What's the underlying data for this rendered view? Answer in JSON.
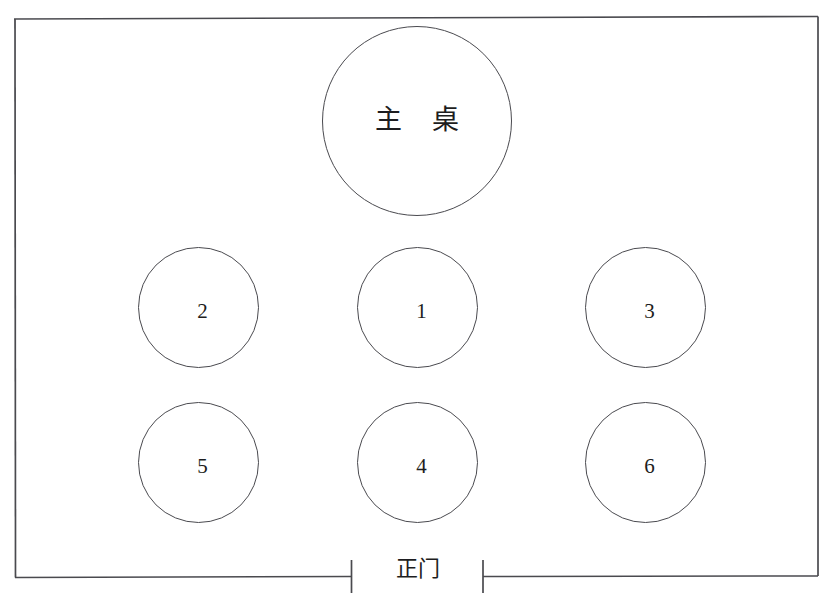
{
  "diagram": {
    "title_text": "主 桌",
    "entrance_label": "正门",
    "line_color": "#4a4a4f",
    "text_color": "#1d1d20",
    "background_color": "#ffffff"
  },
  "room": {
    "name": "banquet-room-outline",
    "x": 14,
    "y": 17,
    "width": 804,
    "height": 560,
    "entrance_gap_start_x": 351,
    "entrance_gap_end_x": 483
  },
  "main_table": {
    "label": "主 桌",
    "center_x": 417,
    "center_y": 121,
    "diameter": 190
  },
  "tables": [
    {
      "label": "2",
      "center_x": 199,
      "center_y": 307,
      "diameter": 121,
      "row": "middle",
      "column": "left"
    },
    {
      "label": "1",
      "center_x": 418,
      "center_y": 307,
      "diameter": 121,
      "row": "middle",
      "column": "center"
    },
    {
      "label": "3",
      "center_x": 646,
      "center_y": 307,
      "diameter": 121,
      "row": "middle",
      "column": "right"
    },
    {
      "label": "5",
      "center_x": 199,
      "center_y": 462,
      "diameter": 121,
      "row": "back",
      "column": "left"
    },
    {
      "label": "4",
      "center_x": 418,
      "center_y": 462,
      "diameter": 121,
      "row": "back",
      "column": "center"
    },
    {
      "label": "6",
      "center_x": 646,
      "center_y": 462,
      "diameter": 121,
      "row": "back",
      "column": "right"
    }
  ]
}
